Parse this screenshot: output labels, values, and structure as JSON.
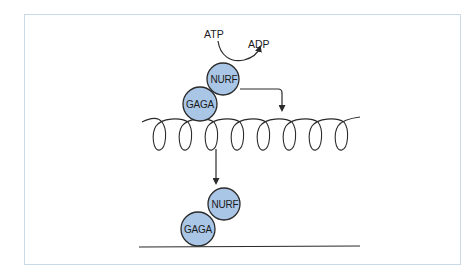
{
  "diagram": {
    "labels": {
      "atp": "ATP",
      "adp": "ADP"
    },
    "top_complex": {
      "nurf": "NURF",
      "gaga": "GAGA"
    },
    "bottom_complex": {
      "nurf": "NURF",
      "gaga": "GAGA"
    },
    "colors": {
      "protein_fill": "#a9c6e6",
      "protein_stroke": "#2a2a2a",
      "frame_border": "#c9d9e6",
      "line": "#2a2a2a"
    },
    "elements": [
      "chromatin-helix (nucleosome-wrapped DNA)",
      "linear-dna (remodeled)",
      "arrow-to-helix",
      "arrow-down-to-linear-dna",
      "atp-hydrolysis-arrow"
    ]
  }
}
